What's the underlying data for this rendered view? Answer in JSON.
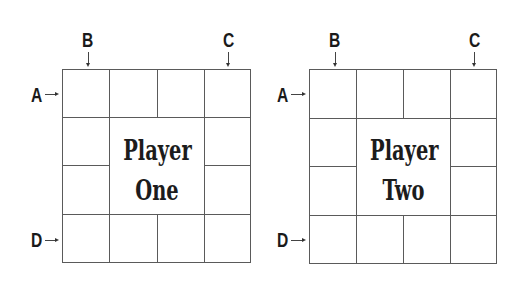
{
  "boards": [
    {
      "title_line1": "Player",
      "title_line2": "One",
      "labels": {
        "a": "A",
        "b": "B",
        "c": "C",
        "d": "D"
      }
    },
    {
      "title_line1": "Player",
      "title_line2": "Two",
      "labels": {
        "a": "A",
        "b": "B",
        "c": "C",
        "d": "D"
      }
    }
  ],
  "colors": {
    "grid_line": "#5a5a5a",
    "text": "#1a1a1a",
    "background": "#ffffff"
  }
}
